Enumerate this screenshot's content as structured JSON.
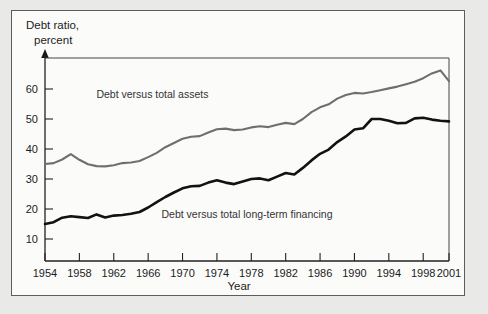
{
  "chart_data": {
    "type": "line",
    "title": "",
    "ylabel_line1": "Debt ratio,",
    "ylabel_line2": "percent",
    "xlabel": "Year",
    "xlim": [
      1954,
      2001
    ],
    "ylim": [
      0,
      70
    ],
    "yticks": [
      10,
      20,
      30,
      40,
      50,
      60
    ],
    "xticks": [
      1954,
      1958,
      1962,
      1966,
      1970,
      1974,
      1978,
      1982,
      1986,
      1990,
      1994,
      1998,
      2001
    ],
    "xtick_labels": [
      "1954",
      "1958",
      "1962",
      "1966",
      "1970",
      "1974",
      "1978",
      "1982",
      "1986",
      "1990",
      "1994",
      "1998",
      "2001"
    ],
    "grid": false,
    "legend_position": "inline-annotation",
    "x": [
      1954,
      1955,
      1956,
      1957,
      1958,
      1959,
      1960,
      1961,
      1962,
      1963,
      1964,
      1965,
      1966,
      1967,
      1968,
      1969,
      1970,
      1971,
      1972,
      1973,
      1974,
      1975,
      1976,
      1977,
      1978,
      1979,
      1980,
      1981,
      1982,
      1983,
      1984,
      1985,
      1986,
      1987,
      1988,
      1989,
      1990,
      1991,
      1992,
      1993,
      1994,
      1995,
      1996,
      1997,
      1998,
      1999,
      2000,
      2001
    ],
    "series": [
      {
        "name": "Debt versus total assets",
        "color": "#6f6f6f",
        "label_x": 1966.5,
        "label_y": 57,
        "values": [
          35.0,
          35.3,
          36.5,
          38.3,
          36.4,
          34.9,
          34.3,
          34.2,
          34.6,
          35.3,
          35.5,
          36.0,
          37.3,
          38.7,
          40.6,
          42.0,
          43.4,
          44.1,
          44.3,
          45.5,
          46.6,
          46.8,
          46.3,
          46.5,
          47.2,
          47.6,
          47.3,
          48.1,
          48.7,
          48.3,
          50.0,
          52.3,
          53.9,
          54.9,
          56.8,
          58.0,
          58.7,
          58.5,
          59.0,
          59.6,
          60.2,
          60.8,
          61.6,
          62.4,
          63.6,
          65.2,
          66.2,
          62.6
        ]
      },
      {
        "name": "Debt versus total long-term financing",
        "color": "#121212",
        "label_x": 1977.5,
        "label_y": 17,
        "values": [
          15.0,
          15.6,
          17.1,
          17.6,
          17.3,
          17.0,
          18.2,
          17.2,
          17.8,
          18.0,
          18.4,
          19.0,
          20.5,
          22.3,
          24.0,
          25.5,
          26.9,
          27.6,
          27.7,
          28.8,
          29.6,
          28.8,
          28.3,
          29.2,
          30.0,
          30.2,
          29.6,
          30.8,
          32.0,
          31.5,
          33.7,
          36.2,
          38.4,
          39.8,
          42.3,
          44.2,
          46.5,
          46.9,
          50.0,
          50.0,
          49.4,
          48.6,
          48.7,
          50.2,
          50.4,
          49.8,
          49.4,
          49.2
        ]
      }
    ]
  }
}
